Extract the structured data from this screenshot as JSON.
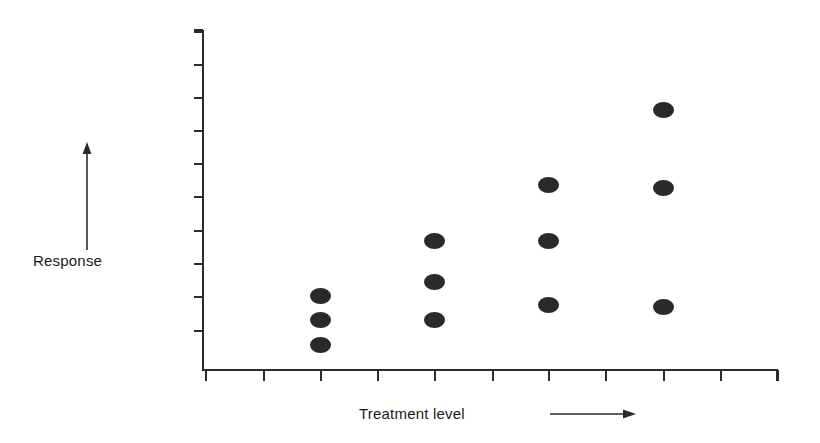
{
  "figure": {
    "background_color": "#ffffff",
    "ink_color": "#2b2b2b",
    "marker_color": "#2a2a2a",
    "ylabel": "Response",
    "xlabel": "Treatment level",
    "y_arrow_icon": "up-arrow-icon",
    "x_arrow_icon": "right-arrow-icon"
  },
  "chart_data": {
    "type": "scatter",
    "title": "",
    "xlabel": "Treatment level",
    "ylabel": "Response",
    "grid": false,
    "legend": null,
    "axes": {
      "x_axis": {
        "origin_px": 203,
        "end_px": 777,
        "tick_positions_px": [
          205,
          263,
          320,
          377,
          434,
          492,
          548,
          605,
          663,
          720,
          777
        ],
        "tick_labels": [],
        "labeled": false,
        "direction_note": "increasing to the right"
      },
      "y_axis": {
        "origin_px": 370,
        "top_px": 30,
        "tick_positions_px": [
          31,
          64,
          97,
          130,
          163,
          196,
          230,
          263,
          296,
          330
        ],
        "tick_labels": [],
        "labeled": false,
        "direction_note": "increasing upward"
      }
    },
    "categories": [
      "1",
      "2",
      "3",
      "4"
    ],
    "group_x_px": [
      320,
      434,
      548,
      663
    ],
    "series": [
      {
        "name": "observations",
        "groups": [
          {
            "category": "1",
            "x_px": 320,
            "y_px": [
              296,
              320,
              345
            ],
            "response_units": [
              2.3,
              1.5,
              0.8
            ]
          },
          {
            "category": "2",
            "x_px": 434,
            "y_px": [
              241,
              282,
              320
            ],
            "response_units": [
              3.9,
              2.7,
              1.5
            ]
          },
          {
            "category": "3",
            "x_px": 548,
            "y_px": [
              185,
              241,
              305
            ],
            "response_units": [
              5.6,
              3.9,
              2.0
            ]
          },
          {
            "category": "4",
            "x_px": 663,
            "y_px": [
              110,
              188,
              307
            ],
            "response_units": [
              7.9,
              5.5,
              1.9
            ]
          }
        ]
      }
    ],
    "point_count": 12,
    "marker": {
      "shape": "filled-ellipse",
      "width_px": 21,
      "height_px": 16,
      "color": "#2a2a2a"
    }
  }
}
